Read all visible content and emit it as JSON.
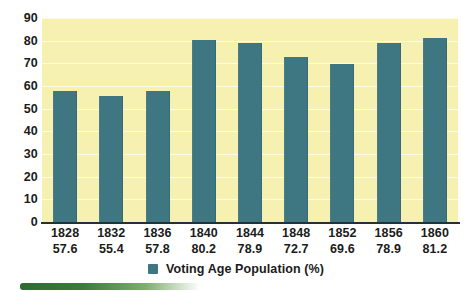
{
  "chart_data": {
    "type": "bar",
    "title": "",
    "xlabel": "",
    "ylabel": "",
    "ylim": [
      0,
      90
    ],
    "grid": true,
    "legend_position": "bottom",
    "categories": [
      "1828",
      "1832",
      "1836",
      "1840",
      "1844",
      "1848",
      "1852",
      "1856",
      "1860"
    ],
    "values": [
      57.6,
      55.4,
      57.8,
      80.2,
      78.9,
      72.7,
      69.6,
      78.9,
      81.2
    ],
    "value_labels": [
      "57.6",
      "55.4",
      "57.8",
      "80.2",
      "78.9",
      "72.7",
      "69.6",
      "78.9",
      "81.2"
    ],
    "y_ticks": [
      "0",
      "10",
      "20",
      "30",
      "40",
      "50",
      "60",
      "70",
      "80",
      "90"
    ],
    "series": [
      {
        "name": "Voting Age Population (%)",
        "values": [
          57.6,
          55.4,
          57.8,
          80.2,
          78.9,
          72.7,
          69.6,
          78.9,
          81.2
        ]
      }
    ],
    "legend": [
      {
        "label": "Voting Age Population (%)",
        "color": "#3e7682"
      }
    ]
  },
  "colors": {
    "bar": "#3e7682",
    "plot_background": "#f6f1b0",
    "gridline": "#fdfbe2",
    "axis": "#24303a",
    "text": "#1b1b1b",
    "accent_green": "#2f6b33"
  },
  "legend": {
    "label": "Voting Age Population (%)",
    "swatch_name": "legend-color-swatch"
  }
}
